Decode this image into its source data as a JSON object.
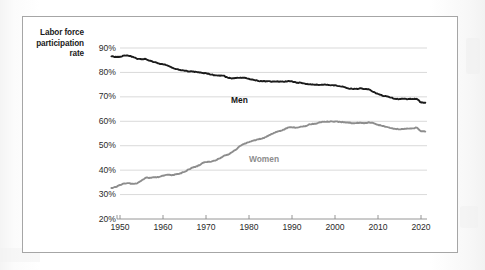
{
  "figure": {
    "axis_label_lines": [
      "Labor force",
      "participation",
      "rate"
    ],
    "axis_label_full": "Labor force participation rate",
    "panel_border_color": "#a6a6a6",
    "background_color": "#ffffff"
  },
  "chart_data": {
    "type": "line",
    "title": "",
    "xlabel": "",
    "ylabel": "Labor force participation rate",
    "xlim": [
      1948,
      2021
    ],
    "ylim": [
      20,
      90
    ],
    "ytick_labels": [
      "90%",
      "80%",
      "70%",
      "60%",
      "50%",
      "40%",
      "30%",
      "20%"
    ],
    "ytick_values": [
      90,
      80,
      70,
      60,
      50,
      40,
      30,
      20
    ],
    "xtick_labels": [
      "1950",
      "1960",
      "1970",
      "1980",
      "1990",
      "2000",
      "2010",
      "2020"
    ],
    "xtick_values": [
      1950,
      1960,
      1970,
      1980,
      1990,
      2000,
      2010,
      2020
    ],
    "grid": true,
    "grid_axis": "y",
    "legend": "inline-annotations",
    "annotations": [
      {
        "text": "Men",
        "x": 1981,
        "y": 74.0,
        "color": "#151515"
      },
      {
        "text": "Women",
        "x": 1985,
        "y": 48.5,
        "color": "#8d8d8d"
      }
    ],
    "series": [
      {
        "name": "Men",
        "color": "#1b1b1b",
        "x": [
          1948,
          1949,
          1950,
          1951,
          1952,
          1953,
          1954,
          1955,
          1956,
          1957,
          1958,
          1959,
          1960,
          1961,
          1962,
          1963,
          1964,
          1965,
          1966,
          1967,
          1968,
          1969,
          1970,
          1971,
          1972,
          1973,
          1974,
          1975,
          1976,
          1977,
          1978,
          1979,
          1980,
          1981,
          1982,
          1983,
          1984,
          1985,
          1986,
          1987,
          1988,
          1989,
          1990,
          1991,
          1992,
          1993,
          1994,
          1995,
          1996,
          1997,
          1998,
          1999,
          2000,
          2001,
          2002,
          2003,
          2004,
          2005,
          2006,
          2007,
          2008,
          2009,
          2010,
          2011,
          2012,
          2013,
          2014,
          2015,
          2016,
          2017,
          2018,
          2019,
          2020,
          2021
        ],
        "y": [
          86.6,
          86.4,
          86.4,
          86.9,
          86.8,
          86.4,
          85.5,
          85.4,
          85.5,
          84.8,
          84.2,
          83.7,
          83.3,
          82.9,
          82.0,
          81.4,
          81.0,
          80.7,
          80.4,
          80.4,
          80.1,
          79.8,
          79.7,
          79.1,
          78.9,
          78.8,
          78.7,
          77.9,
          77.5,
          77.7,
          77.9,
          77.8,
          77.4,
          77.0,
          76.6,
          76.4,
          76.4,
          76.3,
          76.3,
          76.2,
          76.2,
          76.4,
          76.4,
          75.8,
          75.8,
          75.4,
          75.1,
          75.0,
          74.9,
          75.0,
          74.9,
          74.7,
          74.8,
          74.4,
          74.1,
          73.5,
          73.3,
          73.3,
          73.5,
          73.2,
          73.0,
          72.0,
          71.2,
          70.5,
          70.2,
          69.7,
          69.2,
          69.1,
          69.2,
          69.1,
          69.1,
          69.2,
          67.7,
          67.6
        ]
      },
      {
        "name": "Women",
        "color": "#8d8d8d",
        "x": [
          1948,
          1949,
          1950,
          1951,
          1952,
          1953,
          1954,
          1955,
          1956,
          1957,
          1958,
          1959,
          1960,
          1961,
          1962,
          1963,
          1964,
          1965,
          1966,
          1967,
          1968,
          1969,
          1970,
          1971,
          1972,
          1973,
          1974,
          1975,
          1976,
          1977,
          1978,
          1979,
          1980,
          1981,
          1982,
          1983,
          1984,
          1985,
          1986,
          1987,
          1988,
          1989,
          1990,
          1991,
          1992,
          1993,
          1994,
          1995,
          1996,
          1997,
          1998,
          1999,
          2000,
          2001,
          2002,
          2003,
          2004,
          2005,
          2006,
          2007,
          2008,
          2009,
          2010,
          2011,
          2012,
          2013,
          2014,
          2015,
          2016,
          2017,
          2018,
          2019,
          2020,
          2021
        ],
        "y": [
          32.7,
          33.1,
          33.9,
          34.6,
          34.7,
          34.4,
          34.6,
          35.7,
          36.9,
          36.9,
          37.1,
          37.1,
          37.7,
          38.1,
          37.9,
          38.3,
          38.7,
          39.3,
          40.3,
          41.1,
          41.6,
          42.7,
          43.3,
          43.4,
          43.9,
          44.7,
          45.7,
          46.3,
          47.3,
          48.4,
          50.0,
          50.9,
          51.5,
          52.1,
          52.6,
          52.9,
          53.6,
          54.5,
          55.3,
          56.0,
          56.6,
          57.4,
          57.5,
          57.4,
          57.8,
          57.9,
          58.8,
          58.9,
          59.3,
          59.8,
          59.8,
          60.0,
          59.9,
          59.8,
          59.6,
          59.5,
          59.2,
          59.3,
          59.4,
          59.3,
          59.5,
          59.2,
          58.6,
          58.1,
          57.7,
          57.2,
          56.9,
          56.7,
          56.8,
          57.0,
          57.1,
          57.4,
          55.9,
          55.8
        ]
      }
    ]
  }
}
